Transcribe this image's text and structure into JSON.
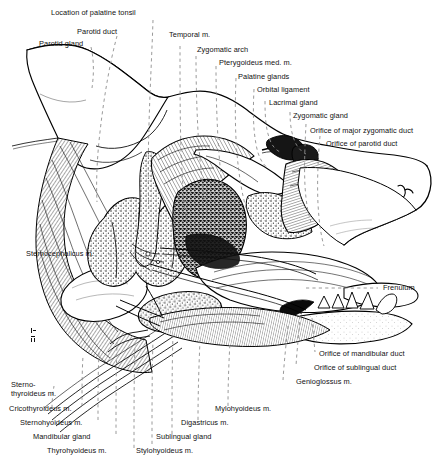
{
  "figure": {
    "style": "pen-and-ink engraving, black line art on white",
    "signature": "artist initials lower left",
    "width": 437,
    "height": 463,
    "line_color": "#000000",
    "leader_color": "#9a9a9a",
    "background": "#ffffff",
    "text_color": "#111111"
  },
  "labels": {
    "location_of_palatine_tonsil": "Location of palatine tonsil",
    "parotid_duct": "Parotid duct",
    "parotid_gland": "Parotid gland",
    "temporal_m": "Temporal m.",
    "zygomatic_arch": "Zygomatic arch",
    "pterygoideus_med_m": "Pterygoideus med. m.",
    "palatine_glands": "Palatine glands",
    "orbital_ligament": "Orbital ligament",
    "lacrimal_gland": "Lacrimal gland",
    "zygomatic_gland": "Zygomatic gland",
    "orifice_of_major_zygomatic_duct": "Orifice of major zygomatic duct",
    "orifice_of_parotid_duct": "Orifice of parotid duct",
    "sternocephalicus_m": "Sternocephalicus m.",
    "frenulum": "Frenulum",
    "orifice_of_mandibular_duct": "Orifice of mandibular duct",
    "orifice_of_sublingual_duct": "Orifice of sublingual duct",
    "genioglossus_m": "Genioglossus m.",
    "sternothyroideus_m_line1": "Sterno-",
    "sternothyroideus_m_line2": "thyroideus m.",
    "cricothyroideus_m": "Cricothyroideus m.",
    "sternohyoideus_m": "Sternohyoideus m.",
    "mandibular_gland": "Mandibular gland",
    "thyrohyoideus_m": "Thyrohyoideus m.",
    "stylohyoideus_m": "Stylohyoideus m.",
    "sublingual_gland": "Sublingual gland",
    "digastricus_m": "Digastricus m.",
    "mylohyoideus_m": "Mylohyoideus m."
  }
}
